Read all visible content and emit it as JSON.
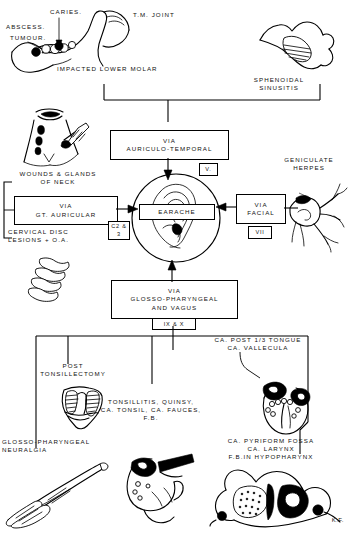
{
  "diagram": {
    "center": {
      "node_label": "EARACHE",
      "icon": "ear-illustration"
    },
    "top_row": {
      "labels": [
        {
          "id": "caries",
          "text": "CARIES."
        },
        {
          "id": "abscess",
          "text": "ABSCESS."
        },
        {
          "id": "tumour",
          "text": "TUMOUR."
        },
        {
          "id": "tm_joint",
          "text": "T.M. JOINT"
        },
        {
          "id": "impacted_lower_molar",
          "text": "IMPACTED LOWER MOLAR"
        },
        {
          "id": "sphenoidal_sinusitis",
          "text": "SPHENOIDAL\nSINUSITIS"
        }
      ],
      "illustrations": [
        {
          "id": "mandible",
          "name": "mandible-illustration"
        },
        {
          "id": "sphenoid",
          "name": "sphenoid-sinus-illustration"
        }
      ]
    },
    "pathways": [
      {
        "id": "auriculo_temporal",
        "box_text": "VIA\nAURICULO-TEMPORAL",
        "nerve_label": "V.",
        "direction": "down"
      },
      {
        "id": "gt_auricular",
        "box_text": "VIA\nGT. AURICULAR",
        "nerve_label": "C2 &\n3",
        "direction": "right"
      },
      {
        "id": "facial",
        "box_text": "VIA\nFACIAL",
        "nerve_label": "VII",
        "direction": "left"
      },
      {
        "id": "glosso_vagus",
        "box_text": "VIA\nGLOSSO-PHARYNGEAL\nAND VAGUS",
        "nerve_label": "IX & X",
        "direction": "up"
      }
    ],
    "left_causes": [
      {
        "id": "wounds_glands_neck",
        "text": "WOUNDS & GLANDS\nOF NECK",
        "illustration": "neck-wound-illustration"
      },
      {
        "id": "cervical_disc",
        "text": "CERVICAL DISC\nLESIONS + O.A.",
        "illustration": "cervical-vertebrae-illustration"
      }
    ],
    "right_causes": [
      {
        "id": "geniculate_herpes",
        "text": "GENICULATE\nHERPES",
        "illustration": "geniculate-nerve-illustration"
      }
    ],
    "bottom_causes": [
      {
        "id": "post_tonsillectomy",
        "text": "POST\nTONSILLECTOMY"
      },
      {
        "id": "glosso_neuralgia",
        "text": "GLOSSO-PHARYNGEAL\nNEURALGIA",
        "illustration": "nerve-forceps-illustration"
      },
      {
        "id": "tonsil_group",
        "text": "TONSILLITIS, QUINSY,\nCA. TONSIL, CA. FAUCES,\nF.B."
      },
      {
        "id": "tongue_vallecula",
        "text": "CA. POST 1/3 TONGUE\nCA. VALLECULA"
      },
      {
        "id": "pyriform_group",
        "text": "CA. PYRIFORM FOSSA\nCA. LARYNX\nF.B.IN HYPOPHARYNX"
      }
    ],
    "bottom_illustrations": [
      {
        "id": "tonsil_fossa",
        "name": "tonsil-fossa-illustration"
      },
      {
        "id": "larynx_forceps",
        "name": "larynx-forceps-illustration"
      },
      {
        "id": "larynx_lesion",
        "name": "larynx-lesion-illustration"
      },
      {
        "id": "hypopharynx_section",
        "name": "hypopharynx-cross-section-illustration"
      }
    ],
    "signature": "K.F."
  },
  "colors": {
    "ink": "#000000",
    "paper": "#ffffff"
  }
}
